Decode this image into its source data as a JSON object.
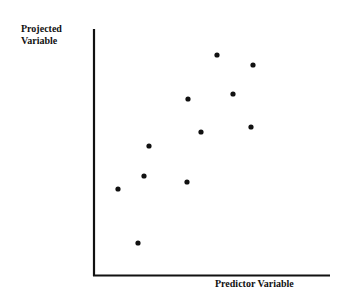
{
  "chart_data": {
    "type": "scatter",
    "title": "",
    "xlabel": "Predictor Variable",
    "ylabel": "Projected Variable",
    "ylabel_lines": [
      "Projected",
      "Variable"
    ],
    "grid": false,
    "legend": null,
    "ticks": "none",
    "xlim": [
      0,
      100
    ],
    "ylim": [
      0,
      100
    ],
    "points": [
      {
        "x": 52,
        "y": 87
      },
      {
        "x": 67,
        "y": 83
      },
      {
        "x": 40,
        "y": 70
      },
      {
        "x": 59,
        "y": 72
      },
      {
        "x": 45,
        "y": 58
      },
      {
        "x": 66,
        "y": 60
      },
      {
        "x": 24,
        "y": 52
      },
      {
        "x": 10,
        "y": 35
      },
      {
        "x": 21,
        "y": 40
      },
      {
        "x": 39,
        "y": 38
      },
      {
        "x": 19,
        "y": 13
      }
    ],
    "pixel_points": [
      [
        217,
        55
      ],
      [
        253,
        65
      ],
      [
        188,
        99
      ],
      [
        233,
        94
      ],
      [
        201,
        132
      ],
      [
        251,
        127
      ],
      [
        149,
        146
      ],
      [
        118,
        189
      ],
      [
        144,
        176
      ],
      [
        187,
        182
      ],
      [
        138,
        243
      ]
    ],
    "colors": {
      "axis": "#111111",
      "point": "#111111"
    }
  }
}
